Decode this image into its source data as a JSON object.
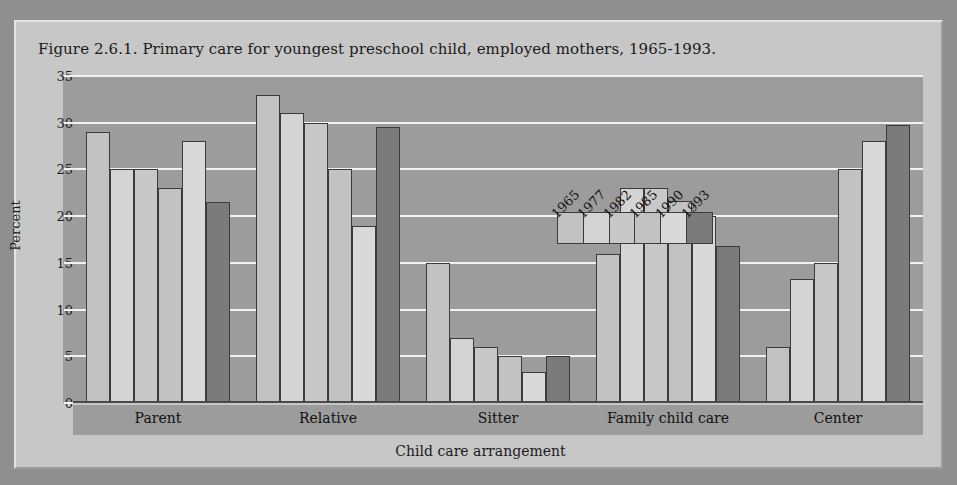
{
  "figure": {
    "title": "Figure 2.6.1. Primary care for youngest preschool child, employed mothers, 1965-1993."
  },
  "chart_data": {
    "type": "bar",
    "title": "Figure 2.6.1. Primary care for youngest preschool child, employed mothers, 1965-1993.",
    "xlabel": "Child care arrangement",
    "ylabel": "Percent",
    "ylim": [
      0,
      35
    ],
    "yticks": [
      0,
      5,
      10,
      15,
      20,
      25,
      30,
      35
    ],
    "grid": true,
    "legend_position": "inside-top-center",
    "categories": [
      "Parent",
      "Relative",
      "Sitter",
      "Family child care",
      "Center"
    ],
    "series": [
      {
        "name": "1965",
        "color": "#c2c2c2",
        "values": [
          29,
          33,
          15,
          16,
          6
        ]
      },
      {
        "name": "1977",
        "color": "#d4d4d4",
        "values": [
          25,
          31,
          7,
          23,
          13.3
        ]
      },
      {
        "name": "1982",
        "color": "#c8c8c8",
        "values": [
          25,
          30,
          6,
          23,
          15
        ]
      },
      {
        "name": "1985",
        "color": "#c2c2c2",
        "values": [
          23,
          25,
          5,
          21.6,
          25
        ]
      },
      {
        "name": "1990",
        "color": "#d9d9d9",
        "values": [
          28,
          19,
          3.3,
          20,
          28
        ]
      },
      {
        "name": "1993",
        "color": "#7b7b7b",
        "values": [
          21.5,
          29.5,
          5,
          16.8,
          29.8
        ]
      }
    ]
  },
  "colors": {
    "page_background": "#8f8f8f",
    "figure_background": "#c7c7c7",
    "plot_background": "#9c9c9c",
    "gridline": "#f2f2f2",
    "bar_outline": "#3b3b3b"
  }
}
